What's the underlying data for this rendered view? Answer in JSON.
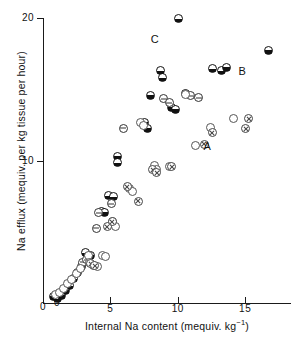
{
  "chart_data": {
    "type": "scatter",
    "title": "",
    "xlabel": "Internal Na content (mequiv. kg⁻¹)",
    "ylabel": "Na efflux (mequiv. per kg tissue per hour)",
    "xlim": [
      0,
      18.4
    ],
    "ylim": [
      0,
      20
    ],
    "xticks": [
      0,
      5,
      10,
      15
    ],
    "xticklabels": [
      "0",
      "5",
      "10",
      "15"
    ],
    "yticks": [
      0,
      10,
      20
    ],
    "yticklabels": [
      "0",
      "10",
      "20"
    ],
    "grid": false,
    "legend_position": "none",
    "annotations": [
      {
        "text": "A",
        "x": 11.9,
        "y": 11.0
      },
      {
        "text": "B",
        "x": 14.5,
        "y": 16.3
      },
      {
        "text": "C",
        "x": 8.0,
        "y": 18.5
      }
    ],
    "series": [
      {
        "name": "half-filled-circle",
        "marker": "half-filled circle (lower half black)",
        "points": [
          [
            0.75,
            0.45
          ],
          [
            1.05,
            0.3
          ],
          [
            1.35,
            0.55
          ],
          [
            1.65,
            0.85
          ],
          [
            1.95,
            1.25
          ],
          [
            2.25,
            1.75
          ],
          [
            2.55,
            2.15
          ],
          [
            2.85,
            2.55
          ],
          [
            3.15,
            3.55
          ],
          [
            3.55,
            3.35
          ],
          [
            4.35,
            6.45
          ],
          [
            4.55,
            6.35
          ],
          [
            4.85,
            7.55
          ],
          [
            5.25,
            7.5
          ],
          [
            5.55,
            10.3
          ],
          [
            5.55,
            9.85
          ],
          [
            7.55,
            12.7
          ],
          [
            7.75,
            12.25
          ],
          [
            7.95,
            14.55
          ],
          [
            8.75,
            16.35
          ],
          [
            8.85,
            15.85
          ],
          [
            9.55,
            13.75
          ],
          [
            9.85,
            13.6
          ],
          [
            10.05,
            19.95
          ],
          [
            10.55,
            14.7
          ],
          [
            12.55,
            16.45
          ],
          [
            13.25,
            16.3
          ],
          [
            13.65,
            16.55
          ],
          [
            16.75,
            17.75
          ]
        ]
      },
      {
        "name": "circle-with-bar",
        "marker": "open circle with horizontal bar",
        "points": [
          [
            2.95,
            2.85
          ],
          [
            3.25,
            3.05
          ],
          [
            3.95,
            5.25
          ],
          [
            4.15,
            6.35
          ],
          [
            5.05,
            6.95
          ],
          [
            5.95,
            12.25
          ],
          [
            8.95,
            14.35
          ],
          [
            9.35,
            14.05
          ],
          [
            10.95,
            14.55
          ],
          [
            11.55,
            14.4
          ]
        ]
      },
      {
        "name": "open-circle",
        "marker": "open circle",
        "points": [
          [
            0.95,
            0.6
          ],
          [
            1.25,
            0.75
          ],
          [
            1.55,
            1.05
          ],
          [
            1.85,
            1.35
          ],
          [
            2.15,
            1.65
          ],
          [
            2.45,
            2.05
          ],
          [
            2.75,
            2.45
          ],
          [
            3.35,
            3.35
          ],
          [
            3.45,
            2.85
          ],
          [
            3.75,
            2.65
          ],
          [
            4.05,
            2.55
          ],
          [
            4.45,
            3.35
          ],
          [
            4.65,
            3.25
          ],
          [
            5.15,
            5.75
          ],
          [
            5.35,
            5.4
          ],
          [
            6.45,
            8.05
          ],
          [
            6.65,
            7.8
          ],
          [
            7.25,
            12.65
          ],
          [
            7.45,
            12.45
          ],
          [
            8.25,
            9.65
          ],
          [
            8.45,
            9.4
          ],
          [
            9.35,
            9.55
          ],
          [
            10.55,
            14.65
          ],
          [
            11.35,
            11.05
          ],
          [
            12.45,
            12.35
          ],
          [
            14.15,
            12.95
          ]
        ]
      },
      {
        "name": "circle-with-cross",
        "marker": "open circle with X",
        "points": [
          [
            3.55,
            2.75
          ],
          [
            3.85,
            2.6
          ],
          [
            4.75,
            5.35
          ],
          [
            5.15,
            5.7
          ],
          [
            6.25,
            8.15
          ],
          [
            7.05,
            7.15
          ],
          [
            8.15,
            9.35
          ],
          [
            8.45,
            9.15
          ],
          [
            9.55,
            9.55
          ],
          [
            11.95,
            11.15
          ],
          [
            12.55,
            11.95
          ],
          [
            15.05,
            12.25
          ],
          [
            15.25,
            12.95
          ]
        ]
      }
    ]
  }
}
